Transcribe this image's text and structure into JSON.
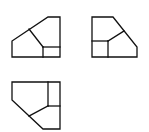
{
  "diagram": {
    "type": "orthographic-views",
    "stroke_color": "#111111",
    "background": "#ffffff",
    "views": [
      {
        "name": "view-top-left",
        "outline": [
          [
            48,
            17
          ],
          [
            60,
            17
          ],
          [
            60,
            57
          ],
          [
            12,
            57
          ],
          [
            12,
            41
          ]
        ],
        "inner_lines": [
          [
            [
              29,
              29
            ],
            [
              43,
              47
            ]
          ],
          [
            [
              43,
              47
            ],
            [
              43,
              57
            ]
          ],
          [
            [
              43,
              47
            ],
            [
              60,
              47
            ]
          ]
        ]
      },
      {
        "name": "view-top-right",
        "outline": [
          [
            92,
            17
          ],
          [
            113,
            17
          ],
          [
            137,
            47
          ],
          [
            137,
            57
          ],
          [
            92,
            57
          ]
        ],
        "inner_lines": [
          [
            [
              92,
              41
            ],
            [
              108,
              41
            ]
          ],
          [
            [
              108,
              41
            ],
            [
              108,
              57
            ]
          ],
          [
            [
              108,
              41
            ],
            [
              124,
              31
            ]
          ]
        ]
      },
      {
        "name": "view-bottom-left",
        "outline": [
          [
            12,
            82
          ],
          [
            60,
            82
          ],
          [
            60,
            129
          ],
          [
            43,
            129
          ],
          [
            12,
            100
          ]
        ],
        "inner_lines": [
          [
            [
              48,
              82
            ],
            [
              48,
              106
            ]
          ],
          [
            [
              48,
              106
            ],
            [
              60,
              106
            ]
          ],
          [
            [
              48,
              106
            ],
            [
              29,
              116
            ]
          ]
        ]
      }
    ]
  }
}
